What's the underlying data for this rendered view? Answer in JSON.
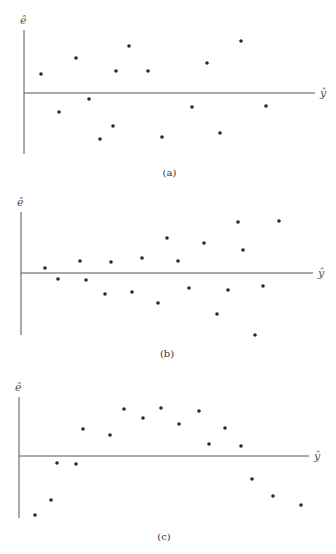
{
  "chart_data": [
    {
      "type": "scatter",
      "title": "",
      "caption": "(a)",
      "xlabel": "ŷ",
      "ylabel": "ê",
      "grid": false,
      "axes_px": {
        "y_axis_x": 24,
        "y_top": 30,
        "y_bottom": 154,
        "x_axis_y": 93,
        "x_left": 24,
        "x_right": 315
      },
      "points_px": [
        [
          41,
          74
        ],
        [
          59,
          112
        ],
        [
          76,
          58
        ],
        [
          89,
          99
        ],
        [
          100,
          139
        ],
        [
          113,
          126
        ],
        [
          116,
          71
        ],
        [
          129,
          46
        ],
        [
          148,
          71
        ],
        [
          162,
          137
        ],
        [
          192,
          107
        ],
        [
          207,
          63
        ],
        [
          220,
          133
        ],
        [
          241,
          41
        ],
        [
          266,
          106
        ]
      ]
    },
    {
      "type": "scatter",
      "title": "",
      "caption": "(b)",
      "xlabel": "ŷ",
      "ylabel": "ê",
      "grid": false,
      "axes_px": {
        "y_axis_x": 21,
        "y_top": 212,
        "y_bottom": 335,
        "x_axis_y": 273,
        "x_left": 21,
        "x_right": 313
      },
      "points_px": [
        [
          45,
          268
        ],
        [
          58,
          279
        ],
        [
          80,
          261
        ],
        [
          86,
          280
        ],
        [
          105,
          294
        ],
        [
          111,
          262
        ],
        [
          132,
          292
        ],
        [
          142,
          258
        ],
        [
          158,
          303
        ],
        [
          167,
          238
        ],
        [
          178,
          261
        ],
        [
          189,
          288
        ],
        [
          204,
          243
        ],
        [
          217,
          314
        ],
        [
          228,
          290
        ],
        [
          238,
          222
        ],
        [
          243,
          250
        ],
        [
          255,
          335
        ],
        [
          263,
          286
        ],
        [
          279,
          221
        ]
      ]
    },
    {
      "type": "scatter",
      "title": "",
      "caption": "(c)",
      "xlabel": "ŷ",
      "ylabel": "ê",
      "grid": false,
      "axes_px": {
        "y_axis_x": 19,
        "y_top": 397,
        "y_bottom": 518,
        "x_axis_y": 456,
        "x_left": 19,
        "x_right": 309
      },
      "points_px": [
        [
          35,
          515
        ],
        [
          51,
          500
        ],
        [
          57,
          463
        ],
        [
          76,
          464
        ],
        [
          83,
          429
        ],
        [
          110,
          435
        ],
        [
          124,
          409
        ],
        [
          143,
          418
        ],
        [
          161,
          408
        ],
        [
          179,
          424
        ],
        [
          199,
          411
        ],
        [
          209,
          444
        ],
        [
          225,
          428
        ],
        [
          241,
          446
        ],
        [
          252,
          479
        ],
        [
          273,
          496
        ],
        [
          301,
          505
        ]
      ]
    }
  ],
  "panels": [
    {
      "caption": "(a)",
      "xlabel": "ŷ",
      "ylabel": "ê"
    },
    {
      "caption": "(b)",
      "xlabel": "ŷ",
      "ylabel": "ê"
    },
    {
      "caption": "(c)",
      "xlabel": "ŷ",
      "ylabel": "ê"
    }
  ]
}
